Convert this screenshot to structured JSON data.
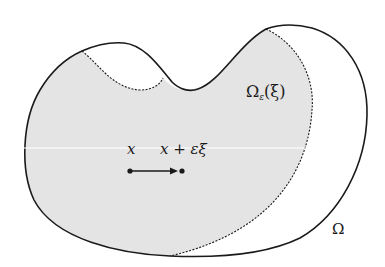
{
  "figure": {
    "colors": {
      "background": "#ffffff",
      "shaded_region": "#e4e4e4",
      "stroke": "#1a1a1a",
      "separator_line": "#ffffff"
    },
    "labels": {
      "subdomain_symbol": "Ω",
      "subdomain_subscript": "ε",
      "subdomain_argument": "(ξ)",
      "point": "x",
      "shifted_point": "x + εξ",
      "domain": "Ω"
    },
    "elements": {
      "outer_boundary": "solid curve (Ω)",
      "inner_boundary": "dashed curve (Ω_ε(ξ))",
      "arrow": "from x to x + εξ"
    }
  }
}
